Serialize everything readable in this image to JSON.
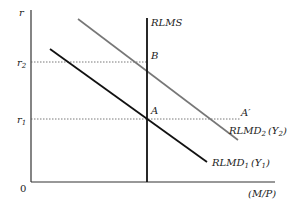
{
  "diagram": {
    "type": "money market diagram",
    "axes": {
      "y_label": "r",
      "x_label": "(M/P)",
      "origin_label": "0"
    },
    "y_ticks": [
      {
        "label": "r",
        "sub": "2",
        "y": 62
      },
      {
        "label": "r",
        "sub": "1",
        "y": 119
      }
    ],
    "curves": [
      {
        "name": "RLMS",
        "label": "RLMS",
        "color": "#111111"
      },
      {
        "name": "RLMD1",
        "label": "RLMD",
        "sub": "1",
        "arg": "(Y",
        "arg_sub": "1",
        "arg_close": ")",
        "color": "#111111"
      },
      {
        "name": "RLMD2",
        "label": "RLMD",
        "sub": "2",
        "arg": "(Y",
        "arg_sub": "2",
        "arg_close": ")",
        "color": "#777777"
      }
    ],
    "points": [
      {
        "label": "A"
      },
      {
        "label": "B"
      },
      {
        "label": "A′"
      }
    ]
  }
}
